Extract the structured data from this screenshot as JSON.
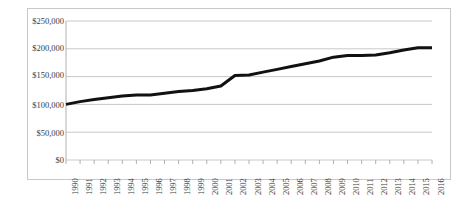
{
  "chart_data": {
    "type": "line",
    "title": "",
    "xlabel": "",
    "ylabel": "",
    "grid": true,
    "legend": "none",
    "ylim": [
      0,
      250000
    ],
    "ytick_labels": [
      "$250,000",
      "$200,000",
      "$150,000",
      "$100,000",
      "$50,000",
      "$0"
    ],
    "ytick_values": [
      250000,
      200000,
      150000,
      100000,
      50000,
      0
    ],
    "categories": [
      "1990",
      "1991",
      "1992",
      "1993",
      "1994",
      "1995",
      "1996",
      "1997",
      "1998",
      "1999",
      "2000",
      "2001",
      "2002",
      "2003",
      "2004",
      "2005",
      "2006",
      "2007",
      "2008",
      "2009",
      "2010",
      "2011",
      "2012",
      "2013",
      "2014",
      "2015",
      "2016"
    ],
    "values": [
      100000,
      105000,
      109000,
      112000,
      115000,
      117000,
      117000,
      120000,
      123000,
      125000,
      128000,
      133000,
      152000,
      153000,
      158000,
      163000,
      168000,
      173000,
      178000,
      185000,
      188000,
      188000,
      189000,
      193000,
      198000,
      202000,
      202000
    ],
    "series": [
      {
        "name": "Value",
        "color": "#111111",
        "line_width": 3,
        "values": [
          100000,
          105000,
          109000,
          112000,
          115000,
          117000,
          117000,
          120000,
          123000,
          125000,
          128000,
          133000,
          152000,
          153000,
          158000,
          163000,
          168000,
          173000,
          178000,
          185000,
          188000,
          188000,
          189000,
          193000,
          198000,
          202000,
          202000
        ]
      }
    ]
  },
  "colors": {
    "line": "#111111",
    "grid": "#c9c9c9",
    "axis": "#b0b0b0",
    "border": "#c8c8c8",
    "text": "#3a3a3a",
    "background": "#ffffff"
  }
}
